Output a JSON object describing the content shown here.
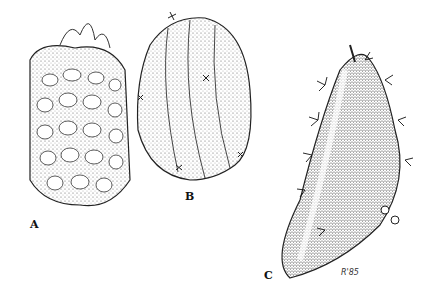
{
  "figure": {
    "labels": [
      "A",
      "B",
      "C"
    ],
    "signature": "R'85",
    "subjects": [
      {
        "label": "A",
        "description": "tuberculate cactus stem with tufted apex"
      },
      {
        "label": "B",
        "description": "ribbed cactus stem segment with areoles"
      },
      {
        "label": "C",
        "description": "elongated spiny ribbed stem with areoles"
      }
    ]
  }
}
